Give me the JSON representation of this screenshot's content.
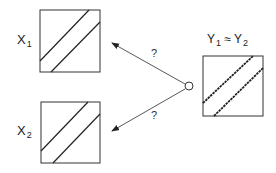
{
  "diagram": {
    "panels": [
      {
        "id": "x1",
        "label_main": "X",
        "label_sub": "1",
        "lines": 2,
        "line_style": "solid"
      },
      {
        "id": "x2",
        "label_main": "X",
        "label_sub": "2",
        "lines": 2,
        "line_style": "solid"
      },
      {
        "id": "y",
        "label_main": "Y",
        "label_sub": "1",
        "label_rel": "≈",
        "label_main2": "Y",
        "label_sub2": "2",
        "lines": 2,
        "line_style": "dotted"
      }
    ],
    "source_node": "circle",
    "arrows": [
      {
        "from": "circle",
        "to": "x1",
        "label": "?"
      },
      {
        "from": "circle",
        "to": "x2",
        "label": "?"
      }
    ]
  }
}
